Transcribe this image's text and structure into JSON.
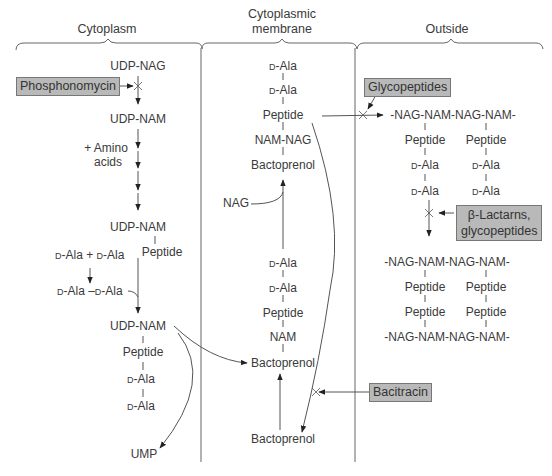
{
  "diagram": {
    "regions": {
      "cytoplasm": "Cytoplasm",
      "membrane_line1": "Cytoplasmic",
      "membrane_line2": "membrane",
      "outside": "Outside"
    },
    "drugs": {
      "phosphonomycin": "Phosphonomycin",
      "glycopeptides": "Glycopeptides",
      "betalactams_line1": "β-Lactarns,",
      "betalactams_line2": "glycopeptides",
      "bacitracin": "Bacitracin"
    },
    "cytoplasm": {
      "udp_nag": "UDP-NAG",
      "udp_nam_1": "UDP-NAM",
      "amino_line1": "+ Amino",
      "amino_line2": "acids",
      "udp_nam_2": "UDP-NAM",
      "peptide_1": "Peptide",
      "dala_plus_prefix1": "D",
      "dala_plus_text1": "-Ala + ",
      "dala_plus_prefix2": "D",
      "dala_plus_text2": "-Ala",
      "dipep_prefix1": "D",
      "dipep_text1": "-Ala –",
      "dipep_prefix2": "D",
      "dipep_text2": "-Ala",
      "udp_nam_3": "UDP-NAM",
      "peptide_2": "Peptide",
      "dala_a_prefix": "D",
      "dala_a_text": "-Ala",
      "dala_b_prefix": "D",
      "dala_b_text": "-Ala",
      "ump": "UMP"
    },
    "membrane": {
      "dala_1_prefix": "D",
      "dala_1_text": "-Ala",
      "dala_2_prefix": "D",
      "dala_2_text": "-Ala",
      "peptide_top": "Peptide",
      "nam_nag": "NAM-NAG",
      "bactoprenol_top": "Bactoprenol",
      "nag": "NAG",
      "dala_3_prefix": "D",
      "dala_3_text": "-Ala",
      "dala_4_prefix": "D",
      "dala_4_text": "-Ala",
      "peptide_mid": "Peptide",
      "nam": "NAM",
      "bactoprenol_mid": "Bactoprenol",
      "bactoprenol_bottom": "Bactoprenol"
    },
    "outside": {
      "chain_top": "-NAG-NAM-NAG-NAM-",
      "peptide_l": "Peptide",
      "peptide_r": "Peptide",
      "dala_l1_prefix": "D",
      "dala_l1_text": "-Ala",
      "dala_r1_prefix": "D",
      "dala_r1_text": "-Ala",
      "dala_l2_prefix": "D",
      "dala_l2_text": "-Ala",
      "dala_r2_prefix": "D",
      "dala_r2_text": "-Ala",
      "chain_mid": "-NAG-NAM-NAG-NAM-",
      "xl_peptide_l1": "Peptide",
      "xl_peptide_r1": "Peptide",
      "xl_peptide_l2": "Peptide",
      "xl_peptide_r2": "Peptide",
      "chain_bottom": "-NAG-NAM-NAG-NAM-"
    },
    "colors": {
      "drug_box_fill": "#b9b9b9",
      "drug_box_border": "#777777",
      "line": "#555555",
      "text": "#3a3a3a"
    }
  }
}
